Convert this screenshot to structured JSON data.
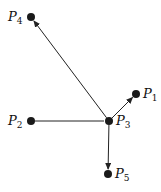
{
  "diagram": {
    "colors": {
      "node": "#1a1a1a",
      "edge": "#222222",
      "background": "#ffffff"
    },
    "nodes": [
      {
        "id": "P1",
        "letter": "P",
        "sub": "1",
        "x": 136,
        "y": 94,
        "label_side": "right"
      },
      {
        "id": "P2",
        "letter": "P",
        "sub": "2",
        "x": 31,
        "y": 121,
        "label_side": "left"
      },
      {
        "id": "P3",
        "letter": "P",
        "sub": "3",
        "x": 109,
        "y": 121,
        "label_side": "right"
      },
      {
        "id": "P4",
        "letter": "P",
        "sub": "4",
        "x": 31,
        "y": 17,
        "label_side": "left"
      },
      {
        "id": "P5",
        "letter": "P",
        "sub": "5",
        "x": 108,
        "y": 174,
        "label_side": "right"
      }
    ],
    "edges": [
      {
        "from": "P3",
        "to": "P4",
        "arrow": true
      },
      {
        "from": "P3",
        "to": "P1",
        "arrow": true
      },
      {
        "from": "P3",
        "to": "P5",
        "arrow": true
      },
      {
        "from": "P2",
        "to": "P3",
        "arrow": false
      }
    ]
  }
}
